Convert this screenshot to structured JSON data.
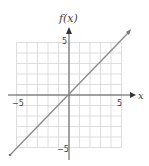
{
  "chart_data": {
    "type": "line",
    "title": "",
    "xlabel": "x",
    "ylabel": "f(x)",
    "xlim": [
      -5,
      5
    ],
    "ylim": [
      -5,
      5
    ],
    "grid": true,
    "x_ticks": [
      "-5",
      "5"
    ],
    "y_ticks": [
      "5",
      "-5"
    ],
    "series": [
      {
        "name": "f(x) = x",
        "x": [
          -6,
          6
        ],
        "y": [
          -6,
          6
        ]
      }
    ]
  },
  "labels": {
    "y_axis": "f(x)",
    "x_axis": "x",
    "x_min": "−5",
    "x_max": "5",
    "y_max": "5",
    "y_min": "−5"
  },
  "colors": {
    "grid": "#d6d6d6",
    "axis": "#555555",
    "line": "#8a8a8a"
  }
}
